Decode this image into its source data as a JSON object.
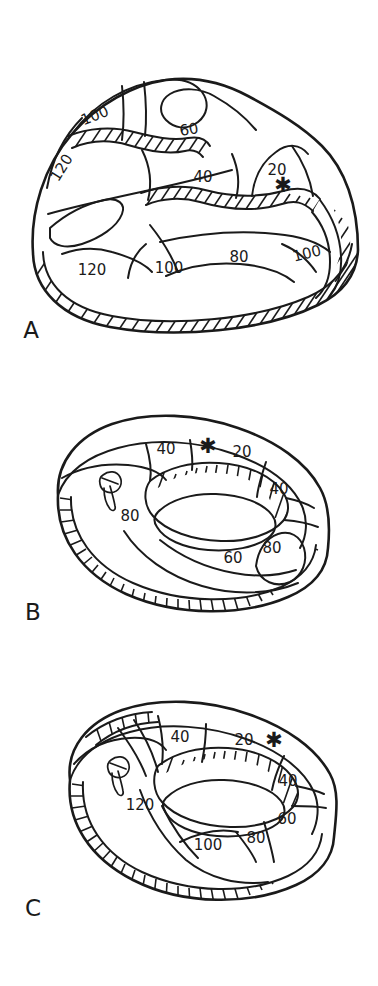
{
  "figure": {
    "background_color": "#ffffff",
    "ink_color": "#1a1a1a",
    "type": "line-drawing-schematic"
  },
  "panels": [
    {
      "id": "A",
      "letter": "A",
      "letter_x": 31,
      "letter_y": 331,
      "contour_labels": [
        {
          "value": "100",
          "x": 95,
          "y": 116,
          "rotate": -22
        },
        {
          "value": "120",
          "x": 62,
          "y": 168,
          "rotate": -58
        },
        {
          "value": "60",
          "x": 189,
          "y": 130,
          "rotate": -10
        },
        {
          "value": "40",
          "x": 203,
          "y": 177,
          "rotate": 0
        },
        {
          "value": "20",
          "x": 277,
          "y": 170,
          "rotate": 0
        },
        {
          "value": "80",
          "x": 239,
          "y": 257,
          "rotate": 0
        },
        {
          "value": "100",
          "x": 307,
          "y": 254,
          "rotate": -14
        },
        {
          "value": "120",
          "x": 92,
          "y": 270,
          "rotate": 0
        },
        {
          "value": "100",
          "x": 169,
          "y": 268,
          "rotate": 0
        }
      ],
      "markers": [
        {
          "kind": "asterisk",
          "glyph": "✱",
          "x": 283,
          "y": 186
        }
      ]
    },
    {
      "id": "B",
      "letter": "B",
      "letter_x": 33,
      "letter_y": 613,
      "contour_labels": [
        {
          "value": "40",
          "x": 166,
          "y": 449,
          "rotate": 0
        },
        {
          "value": "20",
          "x": 242,
          "y": 452,
          "rotate": 0
        },
        {
          "value": "40",
          "x": 279,
          "y": 489,
          "rotate": 0
        },
        {
          "value": "80",
          "x": 130,
          "y": 516,
          "rotate": 0
        },
        {
          "value": "60",
          "x": 233,
          "y": 558,
          "rotate": 0
        },
        {
          "value": "80",
          "x": 272,
          "y": 548,
          "rotate": 0
        }
      ],
      "markers": [
        {
          "kind": "asterisk",
          "glyph": "✱",
          "x": 208,
          "y": 447
        },
        {
          "kind": "teardrop",
          "x": 110,
          "y": 482
        }
      ]
    },
    {
      "id": "C",
      "letter": "C",
      "letter_x": 33,
      "letter_y": 909,
      "contour_labels": [
        {
          "value": "40",
          "x": 180,
          "y": 737,
          "rotate": 0
        },
        {
          "value": "20",
          "x": 244,
          "y": 740,
          "rotate": 0
        },
        {
          "value": "40",
          "x": 288,
          "y": 781,
          "rotate": 0
        },
        {
          "value": "60",
          "x": 287,
          "y": 819,
          "rotate": 0
        },
        {
          "value": "120",
          "x": 140,
          "y": 805,
          "rotate": 0
        },
        {
          "value": "100",
          "x": 208,
          "y": 845,
          "rotate": 0
        },
        {
          "value": "80",
          "x": 256,
          "y": 838,
          "rotate": 0
        }
      ],
      "markers": [
        {
          "kind": "asterisk",
          "glyph": "✱",
          "x": 274,
          "y": 741
        },
        {
          "kind": "teardrop",
          "x": 118,
          "y": 767
        }
      ]
    }
  ]
}
